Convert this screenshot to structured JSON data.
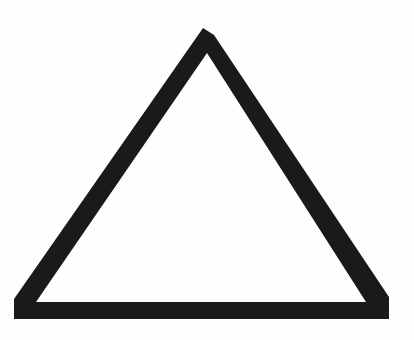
{
  "image": {
    "subject": "triangle outline",
    "background_color": "#ffffff",
    "stroke_color": "#1a1a1a",
    "shape": {
      "type": "triangle",
      "filled": false,
      "outer_vertices": [
        [
          207,
          27
        ],
        [
          14,
          318
        ],
        [
          389,
          318
        ]
      ],
      "inner_vertices": [
        [
          207,
          52
        ],
        [
          35,
          302
        ],
        [
          366,
          302
        ]
      ]
    }
  }
}
